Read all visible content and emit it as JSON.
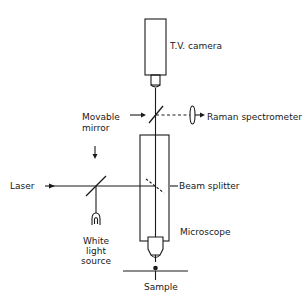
{
  "diagram": {
    "labels": {
      "tv_camera": "T.V. camera",
      "movable_mirror_line1": "Movable",
      "movable_mirror_line2": "mirror",
      "raman_spectrometer": "Raman spectrometer",
      "laser": "Laser",
      "beam_splitter": "Beam splitter",
      "white_light_line1": "White",
      "white_light_line2": "light",
      "white_light_line3": "source",
      "microscope": "Microscope",
      "sample": "Sample"
    },
    "colors": {
      "stroke": "#1a1a1a",
      "background": "#ffffff"
    }
  }
}
